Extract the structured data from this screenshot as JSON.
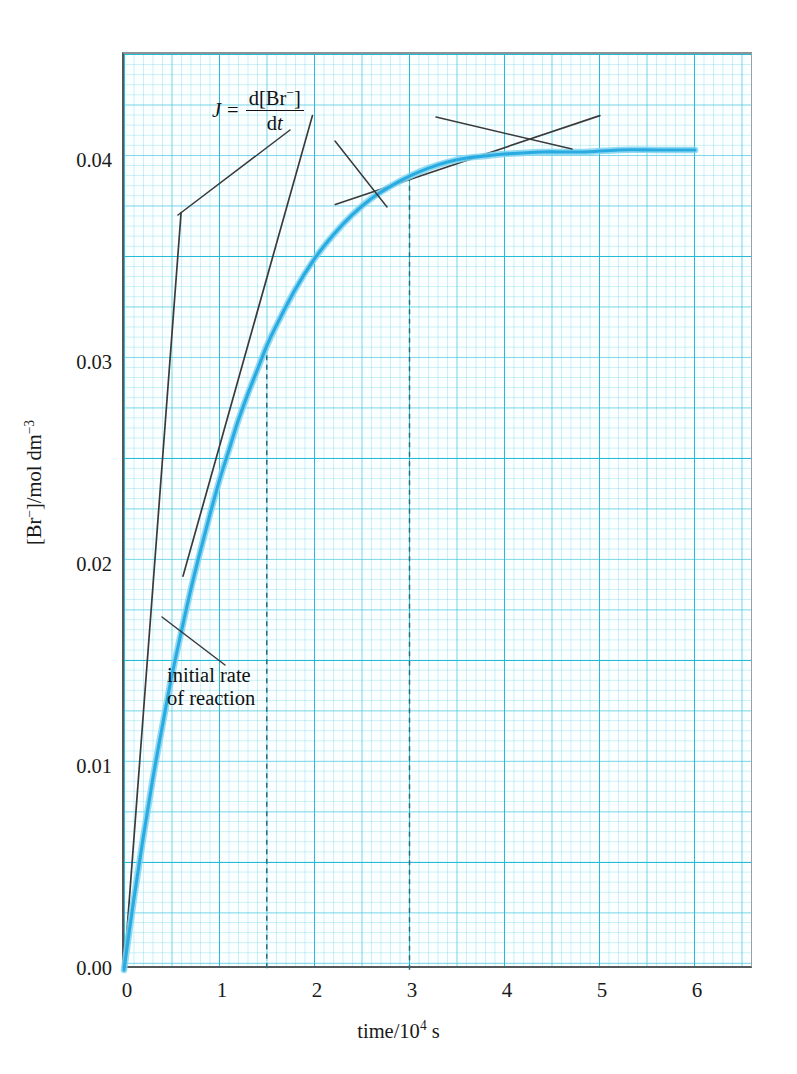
{
  "figure": {
    "background_color": "#ffffff",
    "curve_color": "#29abe2",
    "tangent_color": "#3a3a3a",
    "grid_color": "#20b9d7",
    "frame_color": "#53595b"
  },
  "axes": {
    "x": {
      "title_text": "time/10",
      "title_sup": "4",
      "title_unit": " s",
      "ticks": [
        "0",
        "1",
        "2",
        "3",
        "4",
        "5",
        "6"
      ],
      "tick_values": [
        0,
        1,
        2,
        3,
        4,
        5,
        6
      ],
      "range": [
        0,
        6.62
      ]
    },
    "y": {
      "title_prefix": "[Br",
      "title_charge": "−",
      "title_mid": "]/mol dm",
      "title_sup": "−3",
      "ticks": [
        "0.00",
        "0.01",
        "0.02",
        "0.03",
        "0.04"
      ],
      "tick_values": [
        0.0,
        0.01,
        0.02,
        0.03,
        0.04
      ],
      "range": [
        0,
        0.04535
      ]
    }
  },
  "annotations": {
    "rate_definition": {
      "symbol": "J",
      "equals": "=",
      "numerator_prefix": "d[Br",
      "numerator_charge": "−",
      "numerator_suffix": "]",
      "denominator_d": "d",
      "denominator_t": "t"
    },
    "initial_rate": {
      "line1": "initial rate",
      "line2": "of reaction"
    }
  },
  "chart_data": {
    "type": "line",
    "title": "",
    "xlabel": "time/10^4 s",
    "ylabel": "[Br-]/mol dm^-3",
    "xlim": [
      0,
      6.62
    ],
    "ylim": [
      0,
      0.04535
    ],
    "grid": true,
    "legend": "none",
    "series": [
      {
        "name": "[Br-] vs time",
        "color": "#29abe2",
        "x": [
          0,
          0.1,
          0.2,
          0.3,
          0.4,
          0.5,
          0.6,
          0.7,
          0.8,
          0.9,
          1.0,
          1.1,
          1.2,
          1.3,
          1.4,
          1.5,
          1.6,
          1.8,
          2.0,
          2.2,
          2.4,
          2.6,
          2.8,
          3.0,
          3.2,
          3.4,
          3.6,
          3.8,
          4.0,
          4.4,
          4.8,
          5.2,
          5.6,
          6.0
        ],
        "y": [
          0.0,
          0.0034,
          0.0065,
          0.0094,
          0.012,
          0.0145,
          0.0167,
          0.0188,
          0.0207,
          0.0225,
          0.0242,
          0.0257,
          0.0272,
          0.0285,
          0.0297,
          0.0309,
          0.0319,
          0.0337,
          0.0352,
          0.0364,
          0.0374,
          0.0382,
          0.0388,
          0.0393,
          0.0397,
          0.04,
          0.0402,
          0.0403,
          0.0404,
          0.0405,
          0.0405,
          0.0406,
          0.0406,
          0.0406
        ]
      }
    ],
    "tangents": [
      {
        "name": "initial-rate-tangent",
        "touch_point": [
          0,
          0
        ],
        "x": [
          0,
          0.6
        ],
        "y": [
          0.0,
          0.0375
        ],
        "slope": 0.0625,
        "color": "#3a3a3a"
      },
      {
        "name": "tangent-at-1.5",
        "touch_point": [
          1.5,
          0.0309
        ],
        "x": [
          0.62,
          1.98
        ],
        "y": [
          0.0195,
          0.0423
        ],
        "slope": 0.01676,
        "color": "#3a3a3a"
      },
      {
        "name": "tangent-at-3.0",
        "touch_point": [
          3.0,
          0.0393
        ],
        "x": [
          2.22,
          5.0
        ],
        "y": [
          0.0379,
          0.0423
        ],
        "slope": 0.00158,
        "color": "#3a3a3a"
      }
    ],
    "dashed_markers": [
      {
        "name": "dashed-line-1.5",
        "x": 1.5,
        "y_top": 0.0309
      },
      {
        "name": "dashed-line-3.0",
        "x": 3.0,
        "y_top": 0.0393
      }
    ]
  }
}
